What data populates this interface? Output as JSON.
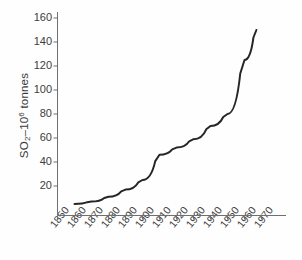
{
  "chart_data": {
    "type": "line",
    "title": "",
    "xlabel": "",
    "ylabel": "SO2-106 tonnes",
    "ylabel_parts": {
      "prefix": "SO",
      "sub": "2",
      "mid": "–10",
      "sup": "6",
      "suffix": " tonnes"
    },
    "xlim": [
      1850,
      1977
    ],
    "ylim": [
      0,
      168
    ],
    "grid": false,
    "legend": null,
    "x": [
      1860,
      1870,
      1880,
      1890,
      1900,
      1910,
      1920,
      1930,
      1940,
      1950,
      1960,
      1967
    ],
    "values": [
      5,
      7,
      11,
      17,
      25,
      46,
      52,
      59,
      70,
      80,
      125,
      150
    ],
    "xticks": [
      1850,
      1860,
      1870,
      1880,
      1890,
      1900,
      1910,
      1920,
      1930,
      1940,
      1950,
      1960,
      1970
    ],
    "xtick_labels": [
      "1850",
      "1860",
      "1870",
      "1880",
      "1890",
      "1900",
      "1910",
      "1920",
      "1930",
      "1940",
      "1950",
      "1960",
      "1970"
    ],
    "yticks": [
      20,
      40,
      60,
      80,
      100,
      120,
      140,
      160
    ],
    "ytick_labels": [
      "20",
      "40",
      "60",
      "80",
      "100",
      "120",
      "140",
      "160"
    ],
    "line_color": "#262626",
    "axis_color": "#6f6f6f",
    "background": "#fefefe"
  },
  "figure": {
    "series_name": "sulphur-dioxide-emissions"
  }
}
